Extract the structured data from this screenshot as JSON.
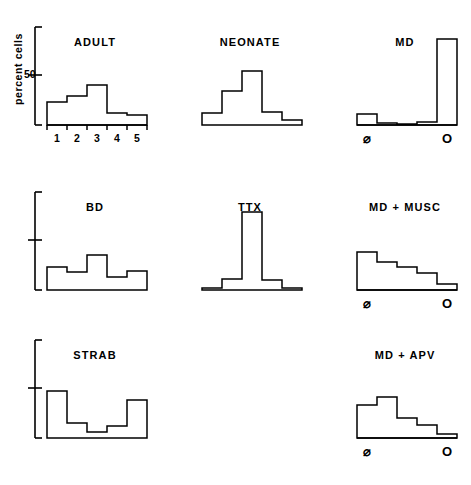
{
  "figure": {
    "ylabel": "percent cells",
    "ytick_label": "50",
    "ytick_value": 50,
    "category_labels": [
      "1",
      "2",
      "3",
      "4",
      "5"
    ],
    "symbol_left": "⌀",
    "symbol_right": "O"
  },
  "chart_data": {
    "type": "bar",
    "xlabel": "",
    "ylabel": "percent cells",
    "ylim": [
      0,
      100
    ],
    "grid": false,
    "legend": "none",
    "categories": [
      "1",
      "2",
      "3",
      "4",
      "5"
    ],
    "axis_tick_labels": [
      "50"
    ],
    "panel_layout": {
      "rows": 3,
      "cols": 3
    },
    "panels": [
      {
        "name": "ADULT",
        "row": 1,
        "col": 1,
        "axis_style": "numeric",
        "has_yaxis": true,
        "categories": [
          "1",
          "2",
          "3",
          "4",
          "5"
        ],
        "values": [
          23,
          29,
          40,
          12,
          10
        ]
      },
      {
        "name": "NEONATE",
        "row": 1,
        "col": 2,
        "axis_style": "none",
        "has_yaxis": false,
        "categories": [
          "1",
          "2",
          "3",
          "4",
          "5"
        ],
        "values": [
          12,
          34,
          54,
          13,
          5
        ]
      },
      {
        "name": "MD",
        "row": 1,
        "col": 3,
        "axis_style": "symbol",
        "has_yaxis": false,
        "categories": [
          "1",
          "2",
          "3",
          "4",
          "5"
        ],
        "values": [
          11,
          2,
          1,
          3,
          86
        ]
      },
      {
        "name": "BD",
        "row": 2,
        "col": 1,
        "axis_style": "none",
        "has_yaxis": true,
        "categories": [
          "1",
          "2",
          "3",
          "4",
          "5"
        ],
        "values": [
          23,
          18,
          35,
          13,
          19
        ]
      },
      {
        "name": "TTX",
        "row": 2,
        "col": 2,
        "axis_style": "none",
        "has_yaxis": false,
        "categories": [
          "1",
          "2",
          "3",
          "4",
          "5"
        ],
        "values": [
          2,
          11,
          78,
          10,
          2
        ]
      },
      {
        "name": "MD + MUSC",
        "row": 2,
        "col": 3,
        "axis_style": "symbol",
        "has_yaxis": false,
        "categories": [
          "1",
          "2",
          "3",
          "4",
          "5"
        ],
        "values": [
          38,
          28,
          23,
          17,
          6
        ]
      },
      {
        "name": "STRAB",
        "row": 3,
        "col": 1,
        "axis_style": "none",
        "has_yaxis": true,
        "categories": [
          "1",
          "2",
          "3",
          "4",
          "5"
        ],
        "values": [
          47,
          15,
          6,
          12,
          38
        ]
      },
      {
        "name": "MD + APV",
        "row": 3,
        "col": 3,
        "axis_style": "symbol",
        "has_yaxis": false,
        "categories": [
          "1",
          "2",
          "3",
          "4",
          "5"
        ],
        "values": [
          33,
          41,
          20,
          13,
          4
        ]
      }
    ]
  }
}
